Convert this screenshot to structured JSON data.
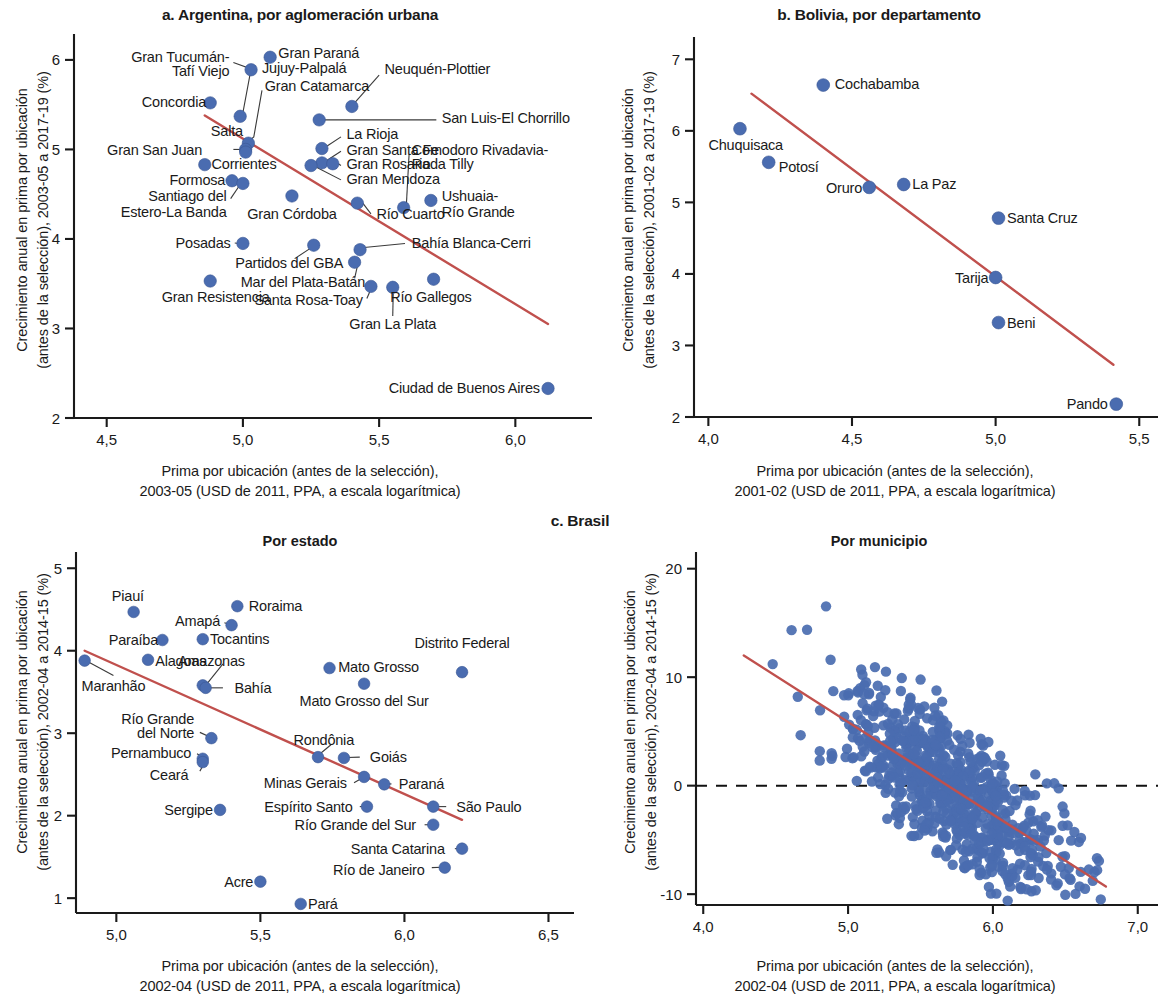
{
  "figure": {
    "panel_a_title": "a. Argentina, por aglomeración urbana",
    "panel_b_title": "b. Bolivia, por departamento",
    "panel_c_title": "c. Brasil",
    "panel_c1_subtitle": "Por estado",
    "panel_c2_subtitle": "Por municipio",
    "colors": {
      "marker": "#4a6cb0",
      "trendline": "#c0504d",
      "axis": "#1a1a1a",
      "text": "#1a1a1a"
    }
  },
  "chart_data": [
    {
      "id": "panel_a",
      "type": "scatter",
      "title": "a. Argentina, por aglomeración urbana",
      "xlabel": "Prima por ubicación (antes de la selección),\n2003-05 (USD de 2011, PPA, a escala logarítmica)",
      "xlabel_line1": "Prima por ubicación (antes de la selección),",
      "xlabel_line2": "2003-05 (USD de 2011, PPA, a escala logarítmica)",
      "ylabel": "Crecimiento anual en prima por ubicación\n(antes de la selección), 2003-05 a 2017-19 (%)",
      "ylabel_line1": "Crecimiento anual en prima por ubicación",
      "ylabel_line2": "(antes de la selección), 2003-05 a 2017-19 (%)",
      "xlim": [
        4.38,
        6.23
      ],
      "ylim": [
        2.0,
        6.2
      ],
      "xticks": [
        "4,5",
        "5,0",
        "5,5",
        "6,0"
      ],
      "xtick_values": [
        4.5,
        5.0,
        5.5,
        6.0
      ],
      "yticks": [
        "2",
        "3",
        "4",
        "5",
        "6"
      ],
      "ytick_values": [
        2,
        3,
        4,
        5,
        6
      ],
      "grid": false,
      "legend": "none",
      "trendline": {
        "x0": 4.86,
        "y0": 5.38,
        "x1": 6.12,
        "y1": 3.05
      },
      "points": [
        {
          "label": "Gran Paraná",
          "x": 5.1,
          "y": 6.03
        },
        {
          "label": "Jujuy-Palpalá",
          "x": 5.03,
          "y": 5.89
        },
        {
          "label": "Concordia",
          "x": 4.88,
          "y": 5.52
        },
        {
          "label": "Neuquén-Plottier",
          "x": 5.4,
          "y": 5.48
        },
        {
          "label": "Gran Tucumán-Tafí Viejo",
          "x": 4.99,
          "y": 5.37
        },
        {
          "label": "San Luis-El Chorrillo",
          "x": 5.28,
          "y": 5.33
        },
        {
          "label": "Gran Catamarca",
          "x": 5.02,
          "y": 5.07
        },
        {
          "label": "La Rioja",
          "x": 5.29,
          "y": 5.01
        },
        {
          "label": "Salta",
          "x": 5.01,
          "y": 5.0
        },
        {
          "label": "Gran San Juan",
          "x": 5.01,
          "y": 4.97
        },
        {
          "label": "Gran Santa Fe",
          "x": 5.29,
          "y": 4.85
        },
        {
          "label": "Gran Rosario",
          "x": 5.33,
          "y": 4.84
        },
        {
          "label": "Corrientes",
          "x": 4.86,
          "y": 4.83
        },
        {
          "label": "Gran Mendoza",
          "x": 5.25,
          "y": 4.82
        },
        {
          "label": "Formosa",
          "x": 4.96,
          "y": 4.65
        },
        {
          "label": "Santiago del Estero-La Banda",
          "x": 5.0,
          "y": 4.62
        },
        {
          "label": "Gran Córdoba",
          "x": 5.18,
          "y": 4.48
        },
        {
          "label": "Ushuaia-Río Grande",
          "x": 5.69,
          "y": 4.43
        },
        {
          "label": "Río Cuarto",
          "x": 5.42,
          "y": 4.4
        },
        {
          "label": "Comodoro Rivadavia-Rada Tilly",
          "x": 5.59,
          "y": 4.35
        },
        {
          "label": "Posadas",
          "x": 5.0,
          "y": 3.95
        },
        {
          "label": "Partidos del GBA",
          "x": 5.26,
          "y": 3.93
        },
        {
          "label": "Bahía Blanca-Cerri",
          "x": 5.43,
          "y": 3.88
        },
        {
          "label": "Mar del Plata-Batán",
          "x": 5.41,
          "y": 3.74
        },
        {
          "label": "Río Gallegos",
          "x": 5.7,
          "y": 3.55
        },
        {
          "label": "Gran Resistencia",
          "x": 4.88,
          "y": 3.53
        },
        {
          "label": "Santa Rosa-Toay",
          "x": 5.47,
          "y": 3.47
        },
        {
          "label": "Gran La Plata",
          "x": 5.55,
          "y": 3.46
        },
        {
          "label": "Ciudad de Buenos Aires",
          "x": 6.12,
          "y": 2.33
        }
      ],
      "callout_labels": [
        {
          "text": "Gran Paraná",
          "x": 5.13,
          "y": 6.08,
          "align": "left"
        },
        {
          "text": "Jujuy-Palpalá",
          "x": 5.07,
          "y": 5.91,
          "align": "left"
        },
        {
          "text": "Gran Tucumán-",
          "x": 4.95,
          "y": 6.03,
          "align": "right"
        },
        {
          "text": "Tafí Viejo",
          "x": 4.95,
          "y": 5.88,
          "align": "right"
        },
        {
          "text": "Concordia",
          "x": 4.865,
          "y": 5.53,
          "align": "right"
        },
        {
          "text": "Neuquén-Plottier",
          "x": 5.52,
          "y": 5.9,
          "align": "left"
        },
        {
          "text": "Gran Catamarca",
          "x": 5.08,
          "y": 5.71,
          "align": "left"
        },
        {
          "text": "San Luis-El Chorrillo",
          "x": 5.73,
          "y": 5.35,
          "align": "left"
        },
        {
          "text": "Salta",
          "x": 5.0,
          "y": 5.21,
          "align": "right"
        },
        {
          "text": "La Rioja",
          "x": 5.38,
          "y": 5.18,
          "align": "left"
        },
        {
          "text": "Gran San Juan",
          "x": 4.85,
          "y": 5.0,
          "align": "right"
        },
        {
          "text": "Gran Santa Fe",
          "x": 5.38,
          "y": 5.0,
          "align": "left"
        },
        {
          "text": "Comodoro Rivadavia-",
          "x": 5.62,
          "y": 5.0,
          "align": "left"
        },
        {
          "text": "Corrientes",
          "x": 4.885,
          "y": 4.84,
          "align": "left"
        },
        {
          "text": "Gran Rosario",
          "x": 5.38,
          "y": 4.84,
          "align": "left"
        },
        {
          "text": "Rada Tilly",
          "x": 5.62,
          "y": 4.84,
          "align": "left"
        },
        {
          "text": "Formosa",
          "x": 4.935,
          "y": 4.66,
          "align": "right"
        },
        {
          "text": "Gran Mendoza",
          "x": 5.38,
          "y": 4.67,
          "align": "left"
        },
        {
          "text": "Santiago del",
          "x": 4.94,
          "y": 4.48,
          "align": "right"
        },
        {
          "text": "Ushuaia-",
          "x": 5.73,
          "y": 4.48,
          "align": "left"
        },
        {
          "text": "Estero-La Banda",
          "x": 4.94,
          "y": 4.3,
          "align": "right"
        },
        {
          "text": "Gran Córdoba",
          "x": 5.18,
          "y": 4.28,
          "align": "center"
        },
        {
          "text": "Río Cuarto",
          "x": 5.49,
          "y": 4.28,
          "align": "left"
        },
        {
          "text": "Río Grande",
          "x": 5.73,
          "y": 4.3,
          "align": "left"
        },
        {
          "text": "Bahía Blanca-Cerri",
          "x": 5.62,
          "y": 3.96,
          "align": "left"
        },
        {
          "text": "Posadas",
          "x": 4.955,
          "y": 3.96,
          "align": "right"
        },
        {
          "text": "Partidos del GBA",
          "x": 5.17,
          "y": 3.73,
          "align": "center"
        },
        {
          "text": "Mar del Plata-Batán",
          "x": 5.22,
          "y": 3.52,
          "align": "center"
        },
        {
          "text": "Gran Resistencia",
          "x": 4.9,
          "y": 3.35,
          "align": "center"
        },
        {
          "text": "Río Gallegos",
          "x": 5.69,
          "y": 3.35,
          "align": "center"
        },
        {
          "text": "Santa Rosa-Toay",
          "x": 5.44,
          "y": 3.32,
          "align": "right"
        },
        {
          "text": "Gran La Plata",
          "x": 5.55,
          "y": 3.05,
          "align": "center"
        },
        {
          "text": "Ciudad de Buenos Aires",
          "x": 6.09,
          "y": 2.34,
          "align": "right"
        }
      ]
    },
    {
      "id": "panel_b",
      "type": "scatter",
      "title": "b. Bolivia, por departamento",
      "xlabel_line1": "Prima por ubicación (antes de la selección),",
      "xlabel_line2": "2001-02 (USD de 2011, PPA, a escala logarítmica)",
      "ylabel_line1": "Crecimiento anual en prima por ubicación",
      "ylabel_line2": "(antes de la selección), 2001-02 a 2017-19 (%)",
      "xlim": [
        3.95,
        5.52
      ],
      "ylim": [
        2.0,
        7.2
      ],
      "xticks": [
        "4,0",
        "4,5",
        "5,0",
        "5,5"
      ],
      "xtick_values": [
        4.0,
        4.5,
        5.0,
        5.5
      ],
      "yticks": [
        "2",
        "3",
        "4",
        "5",
        "6",
        "7"
      ],
      "ytick_values": [
        2,
        3,
        4,
        5,
        6,
        7
      ],
      "grid": false,
      "legend": "none",
      "trendline": {
        "x0": 4.15,
        "y0": 6.52,
        "x1": 5.41,
        "y1": 2.73
      },
      "points": [
        {
          "label": "Cochabamba",
          "x": 4.4,
          "y": 6.64
        },
        {
          "label": "Chuquisaca",
          "x": 4.11,
          "y": 6.03
        },
        {
          "label": "Potosí",
          "x": 4.21,
          "y": 5.56
        },
        {
          "label": "Oruro",
          "x": 4.56,
          "y": 5.21
        },
        {
          "label": "La Paz",
          "x": 4.68,
          "y": 5.25
        },
        {
          "label": "Santa Cruz",
          "x": 5.01,
          "y": 4.78
        },
        {
          "label": "Tarija",
          "x": 5.0,
          "y": 3.95
        },
        {
          "label": "Beni",
          "x": 5.01,
          "y": 3.32
        },
        {
          "label": "Pando",
          "x": 5.42,
          "y": 2.18
        }
      ],
      "callout_labels": [
        {
          "text": "Cochabamba",
          "x": 4.44,
          "y": 6.66,
          "align": "left"
        },
        {
          "text": "Chuquisaca",
          "x": 4.13,
          "y": 5.8,
          "align": "center"
        },
        {
          "text": "Potosí",
          "x": 4.245,
          "y": 5.5,
          "align": "left"
        },
        {
          "text": "Oruro",
          "x": 4.535,
          "y": 5.2,
          "align": "right"
        },
        {
          "text": "La Paz",
          "x": 4.71,
          "y": 5.26,
          "align": "left"
        },
        {
          "text": "Santa Cruz",
          "x": 5.04,
          "y": 4.79,
          "align": "left"
        },
        {
          "text": "Tarija",
          "x": 4.975,
          "y": 3.94,
          "align": "right"
        },
        {
          "text": "Beni",
          "x": 5.04,
          "y": 3.32,
          "align": "left"
        },
        {
          "text": "Pando",
          "x": 5.39,
          "y": 2.18,
          "align": "right"
        }
      ]
    },
    {
      "id": "panel_c1",
      "type": "scatter",
      "title": "Por estado",
      "xlabel_line1": "Prima por ubicación (antes de la selección),",
      "xlabel_line2": "2002-04 (USD de 2011, PPA, a escala logarítmica)",
      "ylabel_line1": "Crecimiento anual en prima por ubicación",
      "ylabel_line2": "(antes de la selección), 2002-04 a 2014-15 (%)",
      "xlim": [
        4.86,
        6.54
      ],
      "ylim": [
        0.82,
        5.1
      ],
      "xticks": [
        "5,0",
        "5,5",
        "6,0",
        "6,5"
      ],
      "xtick_values": [
        5.0,
        5.5,
        6.0,
        6.5
      ],
      "yticks": [
        "1",
        "2",
        "3",
        "4",
        "5"
      ],
      "ytick_values": [
        1,
        2,
        3,
        4,
        5
      ],
      "grid": false,
      "legend": "none",
      "trendline": {
        "x0": 4.89,
        "y0": 4.0,
        "x1": 6.2,
        "y1": 1.95
      },
      "points": [
        {
          "label": "Roraima",
          "x": 5.42,
          "y": 4.54
        },
        {
          "label": "Piauí",
          "x": 5.06,
          "y": 4.47
        },
        {
          "label": "Amapá",
          "x": 5.4,
          "y": 4.31
        },
        {
          "label": "Paraíba",
          "x": 5.16,
          "y": 4.13
        },
        {
          "label": "Tocantins",
          "x": 5.3,
          "y": 4.14
        },
        {
          "label": "Alagoas",
          "x": 5.11,
          "y": 3.89
        },
        {
          "label": "Maranhão",
          "x": 4.89,
          "y": 3.88
        },
        {
          "label": "Mato Grosso",
          "x": 5.74,
          "y": 3.79
        },
        {
          "label": "Distrito Federal",
          "x": 6.2,
          "y": 3.74
        },
        {
          "label": "Amazonas",
          "x": 5.3,
          "y": 3.58
        },
        {
          "label": "Bahía",
          "x": 5.31,
          "y": 3.55
        },
        {
          "label": "Mato Grosso del Sur",
          "x": 5.86,
          "y": 3.6
        },
        {
          "label": "Río Grande del Norte",
          "x": 5.33,
          "y": 2.94
        },
        {
          "label": "Rondônia",
          "x": 5.7,
          "y": 2.71
        },
        {
          "label": "Goiás",
          "x": 5.79,
          "y": 2.7
        },
        {
          "label": "Pernambuco",
          "x": 5.3,
          "y": 2.69
        },
        {
          "label": "Ceará",
          "x": 5.3,
          "y": 2.65
        },
        {
          "label": "Minas Gerais",
          "x": 5.86,
          "y": 2.47
        },
        {
          "label": "Paraná",
          "x": 5.93,
          "y": 2.38
        },
        {
          "label": "Espírito Santo",
          "x": 5.87,
          "y": 2.11
        },
        {
          "label": "São Paulo",
          "x": 6.1,
          "y": 2.11
        },
        {
          "label": "Sergipe",
          "x": 5.36,
          "y": 2.07
        },
        {
          "label": "Río Grande del Sur",
          "x": 6.1,
          "y": 1.89
        },
        {
          "label": "Santa Catarina",
          "x": 6.2,
          "y": 1.6
        },
        {
          "label": "Río de Janeiro",
          "x": 6.14,
          "y": 1.37
        },
        {
          "label": "Acre",
          "x": 5.5,
          "y": 1.2
        },
        {
          "label": "Pará",
          "x": 5.64,
          "y": 0.93
        }
      ],
      "callout_labels": [
        {
          "text": "Piauí",
          "x": 5.04,
          "y": 4.66,
          "align": "center"
        },
        {
          "text": "Roraima",
          "x": 5.46,
          "y": 4.55,
          "align": "left"
        },
        {
          "text": "Amapá",
          "x": 5.36,
          "y": 4.36,
          "align": "right"
        },
        {
          "text": "Paraíba",
          "x": 5.145,
          "y": 4.13,
          "align": "right"
        },
        {
          "text": "Tocantins",
          "x": 5.325,
          "y": 4.14,
          "align": "left"
        },
        {
          "text": "Distrito Federal",
          "x": 6.2,
          "y": 4.1,
          "align": "center"
        },
        {
          "text": "Alagoas",
          "x": 5.135,
          "y": 3.88,
          "align": "left"
        },
        {
          "text": "Amazonas",
          "x": 5.33,
          "y": 3.88,
          "align": "center"
        },
        {
          "text": "Mato Grosso",
          "x": 5.77,
          "y": 3.8,
          "align": "left"
        },
        {
          "text": "Maranhão",
          "x": 4.99,
          "y": 3.58,
          "align": "center"
        },
        {
          "text": "Bahía",
          "x": 5.41,
          "y": 3.55,
          "align": "left"
        },
        {
          "text": "Mato Grosso del Sur",
          "x": 5.86,
          "y": 3.39,
          "align": "center"
        },
        {
          "text": "Río Grande",
          "x": 5.27,
          "y": 3.18,
          "align": "right"
        },
        {
          "text": "del Norte",
          "x": 5.27,
          "y": 3.0,
          "align": "right"
        },
        {
          "text": "Rondônia",
          "x": 5.72,
          "y": 2.92,
          "align": "center"
        },
        {
          "text": "Pernambuco",
          "x": 5.26,
          "y": 2.76,
          "align": "right"
        },
        {
          "text": "Goiás",
          "x": 5.88,
          "y": 2.71,
          "align": "left"
        },
        {
          "text": "Ceará",
          "x": 5.25,
          "y": 2.5,
          "align": "right"
        },
        {
          "text": "Minas Gerais",
          "x": 5.8,
          "y": 2.4,
          "align": "right"
        },
        {
          "text": "Paraná",
          "x": 5.98,
          "y": 2.39,
          "align": "left"
        },
        {
          "text": "Sergipe",
          "x": 5.335,
          "y": 2.07,
          "align": "right"
        },
        {
          "text": "Espírito Santo",
          "x": 5.82,
          "y": 2.11,
          "align": "right"
        },
        {
          "text": "São Paulo",
          "x": 6.18,
          "y": 2.11,
          "align": "left"
        },
        {
          "text": "Río Grande del Sur",
          "x": 6.04,
          "y": 1.89,
          "align": "right"
        },
        {
          "text": "Santa Catarina",
          "x": 6.14,
          "y": 1.6,
          "align": "right"
        },
        {
          "text": "Acre",
          "x": 5.475,
          "y": 1.2,
          "align": "right"
        },
        {
          "text": "Río de Janeiro",
          "x": 6.07,
          "y": 1.34,
          "align": "right"
        },
        {
          "text": "Pará",
          "x": 5.665,
          "y": 0.93,
          "align": "left"
        }
      ]
    },
    {
      "id": "panel_c2",
      "type": "scatter",
      "title": "Por municipio",
      "xlabel_line1": "Prima por ubicación (antes de la selección),",
      "xlabel_line2": "2002-04 (USD de 2011, PPA, a escala logarítmica)",
      "ylabel_line1": "Crecimiento anual en prima por ubicación",
      "ylabel_line2": "(antes de la selección), 2002-04 a 2014-15 (%)",
      "xlim": [
        3.95,
        7.05
      ],
      "ylim": [
        -11.0,
        20.8
      ],
      "xticks": [
        "4,0",
        "5,0",
        "6,0",
        "7,0"
      ],
      "xtick_values": [
        4.0,
        5.0,
        6.0,
        7.0
      ],
      "yticks": [
        "-10",
        "0",
        "10",
        "20"
      ],
      "ytick_values": [
        -10,
        0,
        10,
        20
      ],
      "grid": false,
      "legend": "none",
      "zero_reference_line": 0,
      "trendline": {
        "x0": 4.28,
        "y0": 12.0,
        "x1": 6.78,
        "y1": -9.3
      },
      "n_points": 760,
      "cloud_note": "Dense scatter cloud of Brazilian municipalities, negative correlation",
      "cloud": {
        "x_mean": 5.72,
        "x_sd": 0.42,
        "x_min": 4.22,
        "x_max": 6.85,
        "y_intercept": 48.5,
        "y_slope": -8.52,
        "y_resid_sd": 3.05,
        "y_min": -10.6,
        "y_max": 17.6
      }
    }
  ]
}
